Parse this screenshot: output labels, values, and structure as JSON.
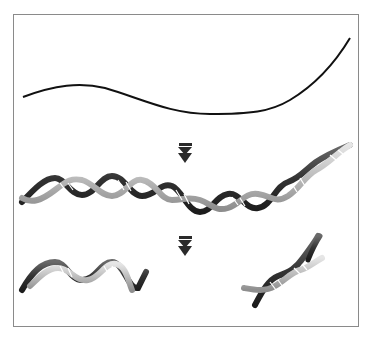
{
  "figure": {
    "title": "DNA strand cleavage diagram",
    "stages": [
      {
        "id": "single-strand",
        "label": "Single strand (line)"
      },
      {
        "id": "double-helix",
        "label": "Long double helix"
      },
      {
        "id": "fragments",
        "label": "Cleaved helix fragments"
      }
    ],
    "arrows": [
      {
        "id": "arrow-1",
        "glyph": "double-down-arrow"
      },
      {
        "id": "arrow-2",
        "glyph": "double-down-arrow"
      }
    ],
    "colors": {
      "frame": "#8a8a8a",
      "line": "#111111",
      "strand_light": "#bdbdbd",
      "strand_dark": "#3a3a3a",
      "arrow": "#2a2a2a",
      "rung": "#ffffff"
    }
  }
}
